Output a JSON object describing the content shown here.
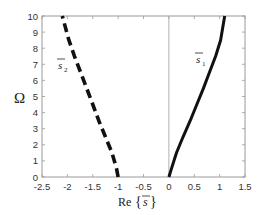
{
  "chart_data": {
    "type": "line",
    "title": "",
    "xlabel": "Re{s̄}",
    "ylabel": "Ω",
    "xlim": [
      -2.5,
      1.5
    ],
    "ylim": [
      0,
      10
    ],
    "xticks": [
      -2.5,
      -2,
      -1.5,
      -1,
      -0.5,
      0,
      0.5,
      1,
      1.5
    ],
    "xtick_labels": [
      "-2.5",
      "-2",
      "-1.5",
      "-1",
      "-0.5",
      "0",
      "0.5",
      "1",
      "1.5"
    ],
    "yticks": [
      0,
      1,
      2,
      3,
      4,
      5,
      6,
      7,
      8,
      9,
      10
    ],
    "ytick_labels": [
      "0",
      "1",
      "2",
      "3",
      "4",
      "5",
      "6",
      "7",
      "8",
      "9",
      "10"
    ],
    "grid": false,
    "reference_lines": [
      {
        "axis": "x",
        "value": 0,
        "style": "thin solid gray"
      }
    ],
    "legend": "none (inline labels)",
    "series": [
      {
        "name": "s̄1",
        "label_main": "s",
        "label_sub": "1",
        "style": "solid",
        "color": "#111111",
        "x": [
          0.0,
          0.05,
          0.15,
          0.28,
          0.42,
          0.55,
          0.68,
          0.8,
          0.92,
          1.02,
          1.1
        ],
        "y": [
          0,
          0.5,
          1.5,
          2.5,
          3.5,
          4.5,
          5.5,
          6.5,
          7.5,
          8.5,
          10
        ]
      },
      {
        "name": "s̄2",
        "label_main": "s",
        "label_sub": "2",
        "style": "dashed",
        "color": "#111111",
        "x": [
          -1.0,
          -1.03,
          -1.12,
          -1.25,
          -1.38,
          -1.5,
          -1.62,
          -1.74,
          -1.86,
          -1.97,
          -2.1
        ],
        "y": [
          0,
          0.5,
          1.5,
          2.5,
          3.5,
          4.5,
          5.5,
          6.5,
          7.5,
          8.5,
          10
        ]
      }
    ],
    "annotations": [
      {
        "text": "s̄2",
        "x": -2.0,
        "y": 7.3
      },
      {
        "text": "s̄1",
        "x": 0.55,
        "y": 8.3
      }
    ]
  },
  "labels": {
    "ylabel": "Ω",
    "xlabel_prefix": "Re",
    "xlabel_open": "{",
    "xlabel_var": "s",
    "xlabel_close": "}",
    "s1_main": "s",
    "s1_sub": "1",
    "s2_main": "s",
    "s2_sub": "2"
  }
}
